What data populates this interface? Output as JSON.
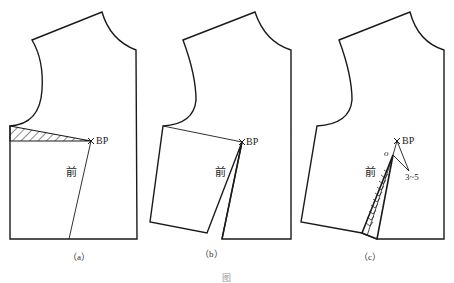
{
  "panels": [
    {
      "id": "a",
      "caption": "（a）",
      "bp_label": "BP",
      "front_label": "前"
    },
    {
      "id": "b",
      "caption": "（b）",
      "bp_label": "BP",
      "front_label": "前"
    },
    {
      "id": "c",
      "caption": "（c）",
      "bp_label": "BP",
      "front_label": "前",
      "point_label": "o",
      "dimension_label": "3~5"
    }
  ],
  "figure_caption": "图",
  "colors": {
    "line": "#1a1a1a",
    "background": "#ffffff"
  }
}
